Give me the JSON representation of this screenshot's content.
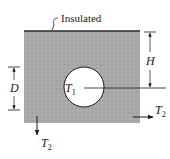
{
  "diagram": {
    "colors": {
      "slab_fill": "#a8a8a8",
      "top_edge": "#2a2a2a",
      "cylinder_fill": "#ffffff",
      "line": "#1a1a1a"
    },
    "labels": {
      "insulated": "Insulated",
      "height": "H",
      "depth": "D",
      "cylinder_temp": "T",
      "cylinder_temp_sub": "1",
      "right_temp": "T",
      "right_temp_sub": "2",
      "bottom_temp": "T",
      "bottom_temp_sub": "2"
    },
    "elements": [
      {
        "name": "slab",
        "shape": "rectangle",
        "x": 24,
        "y": 31,
        "width": 116,
        "height": 92
      },
      {
        "name": "insulated-top-edge",
        "shape": "line",
        "from": [
          24,
          31
        ],
        "to": [
          140,
          31
        ]
      },
      {
        "name": "cylinder",
        "shape": "circle",
        "cx": 84,
        "cy": 87,
        "r": 20
      },
      {
        "name": "centerline",
        "shape": "line",
        "from": [
          84,
          88
        ],
        "to": [
          166,
          88
        ]
      },
      {
        "name": "H-dimension",
        "shape": "dimension",
        "x": 150,
        "from_y": 32,
        "to_y": 88
      },
      {
        "name": "D-dimension",
        "shape": "dimension",
        "x": 14,
        "from_y": 67,
        "to_y": 110
      },
      {
        "name": "right-heat-arrow",
        "shape": "arrow",
        "from": [
          133,
          117
        ],
        "to": [
          153,
          117
        ]
      },
      {
        "name": "bottom-heat-arrow",
        "shape": "arrow",
        "from": [
          37,
          117
        ],
        "to": [
          37,
          134
        ]
      }
    ]
  }
}
